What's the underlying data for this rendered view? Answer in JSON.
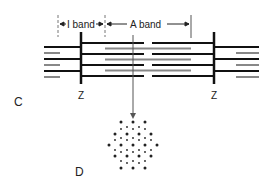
{
  "diagram": {
    "labels": {
      "i_band": "I band",
      "a_band": "A band",
      "z_left": "Z",
      "z_right": "Z",
      "panel_c": "C",
      "panel_d": "D"
    },
    "colors": {
      "thin_filament": "#111111",
      "thick_filament": "#888888",
      "z_line": "#111111",
      "arrow": "#555555",
      "dots": "#222222"
    }
  }
}
